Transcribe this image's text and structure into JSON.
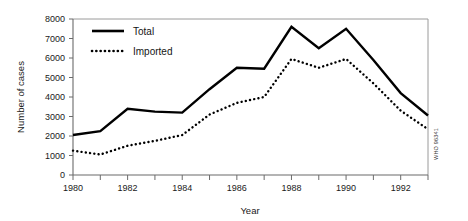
{
  "chart_data": {
    "type": "line",
    "title": "",
    "xlabel": "Year",
    "ylabel": "Number of cases",
    "x": [
      1980,
      1981,
      1982,
      1983,
      1984,
      1985,
      1986,
      1987,
      1988,
      1989,
      1990,
      1991,
      1992,
      1993
    ],
    "xlim": [
      1980,
      1993
    ],
    "ylim": [
      0,
      8000
    ],
    "ytick_labels": [
      "0",
      "1000",
      "2000",
      "3000",
      "4000",
      "5000",
      "6000",
      "7000",
      "8000"
    ],
    "ytick_values": [
      0,
      1000,
      2000,
      3000,
      4000,
      5000,
      6000,
      7000,
      8000
    ],
    "xtick_values": [
      1980,
      1981,
      1982,
      1983,
      1984,
      1985,
      1986,
      1987,
      1988,
      1989,
      1990,
      1991,
      1992,
      1993
    ],
    "xtick_labels_shown": [
      "1980",
      "1982",
      "1984",
      "1986",
      "1988",
      "1990",
      "1992"
    ],
    "xtick_labeled_values": [
      1980,
      1982,
      1984,
      1986,
      1988,
      1990,
      1992
    ],
    "grid": false,
    "legend_position": "top-left-inside",
    "series": [
      {
        "name": "Total",
        "style": "solid",
        "color": "#000000",
        "values": [
          2050,
          2250,
          3400,
          3250,
          3200,
          4400,
          5500,
          5450,
          7600,
          6500,
          7500,
          5900,
          4200,
          3050
        ]
      },
      {
        "name": "Imported",
        "style": "dotted",
        "color": "#000000",
        "values": [
          1250,
          1050,
          1500,
          1750,
          2050,
          3100,
          3700,
          4000,
          5950,
          5500,
          5950,
          4700,
          3300,
          2350
        ]
      }
    ],
    "annotations": [
      {
        "name": "source-credit",
        "text": "WHO 96341",
        "orientation": "vertical"
      }
    ]
  },
  "legend": {
    "items": [
      {
        "label": "Total"
      },
      {
        "label": "Imported"
      }
    ]
  },
  "axes": {
    "y_title": "Number of cases",
    "x_title": "Year"
  },
  "source": {
    "text": "WHO 96341"
  }
}
